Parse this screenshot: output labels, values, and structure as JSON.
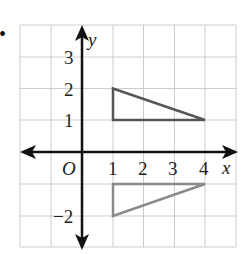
{
  "diagram": {
    "type": "coordinate-grid-reflection",
    "bullet": "•",
    "axes": {
      "x_label": "x",
      "y_label": "y",
      "origin_label": "O",
      "x_ticks": [
        "1",
        "2",
        "3",
        "4"
      ],
      "y_ticks": [
        "3",
        "2",
        "1",
        "−2"
      ]
    },
    "grid": {
      "x_range": [
        -2,
        5
      ],
      "y_range": [
        -3,
        4
      ]
    },
    "shapes": [
      {
        "name": "original-triangle",
        "vertices": [
          [
            1,
            2
          ],
          [
            1,
            1
          ],
          [
            4,
            1
          ]
        ],
        "color": "#555555"
      },
      {
        "name": "reflected-triangle",
        "vertices": [
          [
            1,
            -2
          ],
          [
            1,
            -1
          ],
          [
            4,
            -1
          ]
        ],
        "color": "#8a8a8a"
      }
    ],
    "colors": {
      "grid": "#cccccc",
      "axis": "#111111"
    }
  }
}
